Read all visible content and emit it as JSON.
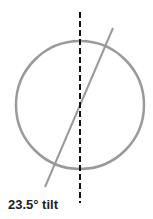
{
  "diagram": {
    "label": "23.5° tilt",
    "colors": {
      "circle": "#9a9a9a",
      "axis": "#111111",
      "tilt_line": "#9a9a9a",
      "text": "#222222"
    },
    "circle": {
      "cx": 80,
      "cy": 105,
      "r": 64
    },
    "vertical_axis": {
      "x": 80,
      "y1": 12,
      "y2": 203,
      "style": "dashed"
    },
    "tilted_axis": {
      "x1": 45,
      "y1": 187,
      "x2": 113,
      "y2": 28,
      "angle_deg": 23.5
    }
  }
}
